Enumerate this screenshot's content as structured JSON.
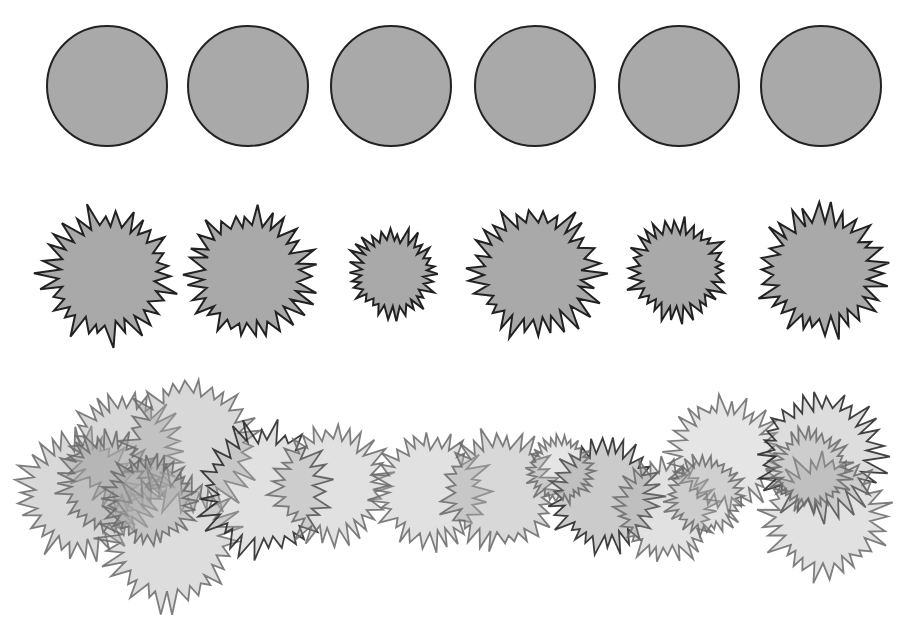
{
  "figure": {
    "colors": {
      "background": "#ffffff",
      "fill": "#a9a9a9",
      "fill_light": "#c4c4c4",
      "stroke_dark": "#222222",
      "stroke_mid": "#6a6a6a"
    },
    "rows": [
      {
        "name": "circles",
        "count": 6
      },
      {
        "name": "spiky-blobs",
        "count": 6
      },
      {
        "name": "overlapping-spiky-blobs",
        "count": 18
      }
    ]
  }
}
